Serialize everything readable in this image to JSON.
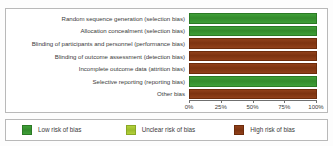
{
  "chart_data": {
    "type": "bar",
    "orientation": "horizontal",
    "title": "",
    "xlabel": "",
    "ylabel": "",
    "xlim": [
      0,
      100
    ],
    "grid": false,
    "legend_position": "bottom",
    "categories": [
      "Random sequence generation (selection bias)",
      "Allocation concealment (selection bias)",
      "Blinding of participants and personnel (performance bias)",
      "Blinding of outcome assessment (detection bias)",
      "Incomplete outcome data (attrition bias)",
      "Selective reporting (reporting bias)",
      "Other bias"
    ],
    "series": [
      {
        "name": "Low risk of bias",
        "color": "#3c9a34",
        "values": [
          100,
          100,
          0,
          0,
          0,
          100,
          0
        ]
      },
      {
        "name": "Unclear risk of bias",
        "color": "#a8c832",
        "values": [
          0,
          0,
          0,
          0,
          0,
          0,
          0
        ]
      },
      {
        "name": "High risk of bias",
        "color": "#8c3c16",
        "values": [
          0,
          0,
          100,
          100,
          100,
          0,
          100
        ]
      }
    ],
    "xticks": [
      0,
      25,
      50,
      75,
      100
    ],
    "xtick_labels": [
      "0%",
      "25%",
      "50%",
      "75%",
      "100%"
    ]
  },
  "rows": [
    {
      "label": "Random sequence generation (selection bias)",
      "risk": "low",
      "value": 100
    },
    {
      "label": "Allocation concealment (selection bias)",
      "risk": "low",
      "value": 100
    },
    {
      "label": "Blinding of participants and personnel (performance bias)",
      "risk": "high",
      "value": 100
    },
    {
      "label": "Blinding of outcome assessment (detection bias)",
      "risk": "high",
      "value": 100
    },
    {
      "label": "Incomplete outcome data (attrition bias)",
      "risk": "high",
      "value": 100
    },
    {
      "label": "Selective reporting (reporting bias)",
      "risk": "low",
      "value": 100
    },
    {
      "label": "Other bias",
      "risk": "high",
      "value": 100
    }
  ],
  "axis": {
    "ticks": [
      {
        "label": "0%",
        "pos": 0
      },
      {
        "label": "25%",
        "pos": 25
      },
      {
        "label": "50%",
        "pos": 50
      },
      {
        "label": "75%",
        "pos": 75
      },
      {
        "label": "100%",
        "pos": 100
      }
    ]
  },
  "legend": {
    "items": [
      {
        "label": "Low risk of bias",
        "risk": "low",
        "color": "#3c9a34"
      },
      {
        "label": "Unclear risk of bias",
        "risk": "unclear",
        "color": "#a8c832"
      },
      {
        "label": "High risk of bias",
        "risk": "high",
        "color": "#8c3c16"
      }
    ]
  },
  "colors": {
    "low": "#3c9a34",
    "unclear": "#a8c832",
    "high": "#8c3c16",
    "text": "#3b3b3b",
    "border": "#b9b9b9",
    "background": "#ffffff"
  }
}
